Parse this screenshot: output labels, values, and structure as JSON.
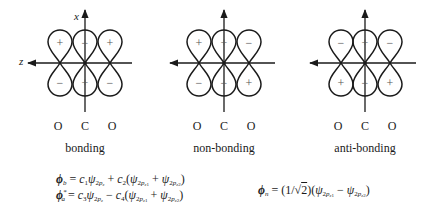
{
  "axes": {
    "x_label": "x",
    "z_label": "z"
  },
  "diagrams": [
    {
      "name": "bonding",
      "label": "bonding",
      "cx": 85,
      "top_signs": [
        "+",
        "−",
        "+"
      ],
      "bottom_signs": [
        "−",
        "+",
        "−"
      ],
      "atoms": [
        "O",
        "C",
        "O"
      ]
    },
    {
      "name": "non-bonding",
      "label": "non-bonding",
      "cx": 224,
      "top_signs": [
        "+",
        "+",
        "−"
      ],
      "bottom_signs": [
        "−",
        "−",
        "+"
      ],
      "atoms": [
        "O",
        "C",
        "O"
      ]
    },
    {
      "name": "anti-bonding",
      "label": "anti-bonding",
      "cx": 365,
      "top_signs": [
        "−",
        "+",
        "−"
      ],
      "bottom_signs": [
        "+",
        "−",
        "+"
      ],
      "atoms": [
        "O",
        "C",
        "O"
      ]
    }
  ],
  "equations": {
    "phi_b": "ϕ_b = c1ψ2pz + c2(ψ2pz1 + ψ2pz2)",
    "phi_a_star": "ϕ*_a = c3ψ2pz − c4(ψ2pz1 + ψ2pz2)",
    "phi_n": "ϕ_n = (1/√2)(ψ2pz1 − ψ2pz2)"
  },
  "colors": {
    "line": "#1a1a1a",
    "background": "#ffffff"
  }
}
